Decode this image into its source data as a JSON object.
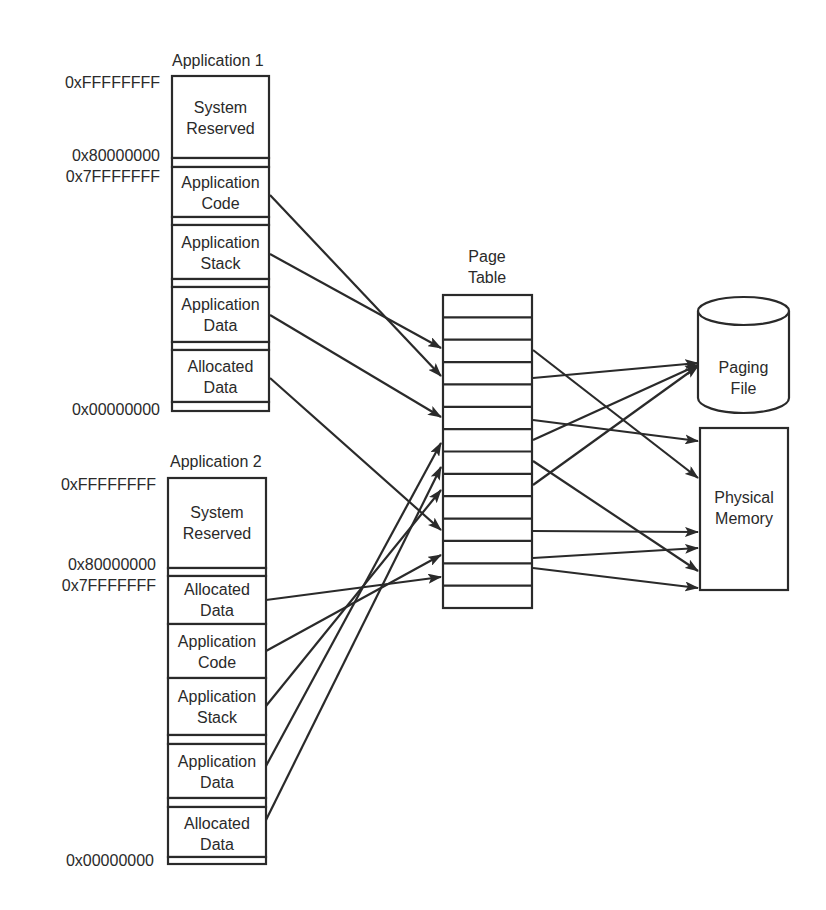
{
  "app1": {
    "title": "Application 1",
    "addresses": {
      "top": "0xFFFFFFFF",
      "mid_high": "0x80000000",
      "mid_low": "0x7FFFFFFF",
      "bottom": "0x00000000"
    },
    "segments": [
      {
        "line1": "System",
        "line2": "Reserved"
      },
      {
        "line1": "Application",
        "line2": "Code"
      },
      {
        "line1": "Application",
        "line2": "Stack"
      },
      {
        "line1": "Application",
        "line2": "Data"
      },
      {
        "line1": "Allocated",
        "line2": "Data"
      }
    ]
  },
  "app2": {
    "title": "Application 2",
    "addresses": {
      "top": "0xFFFFFFFF",
      "mid_high": "0x80000000",
      "mid_low": "0x7FFFFFFF",
      "bottom": "0x00000000"
    },
    "segments": [
      {
        "line1": "System",
        "line2": "Reserved"
      },
      {
        "line1": "Allocated",
        "line2": "Data"
      },
      {
        "line1": "Application",
        "line2": "Code"
      },
      {
        "line1": "Application",
        "line2": "Stack"
      },
      {
        "line1": "Application",
        "line2": "Data"
      },
      {
        "line1": "Allocated",
        "line2": "Data"
      }
    ]
  },
  "page_table": {
    "title_line1": "Page",
    "title_line2": "Table",
    "rows": 14
  },
  "paging_file": {
    "line1": "Paging",
    "line2": "File"
  },
  "physical_memory": {
    "line1": "Physical",
    "line2": "Memory"
  },
  "colors": {
    "stroke": "#2a2a2a",
    "background": "#ffffff"
  }
}
